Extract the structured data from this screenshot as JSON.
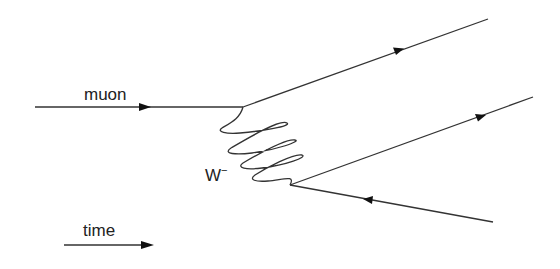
{
  "diagram": {
    "type": "feynman-diagram",
    "labels": {
      "incoming": "muon",
      "boson": "W",
      "boson_charge": "−",
      "time_axis": "time"
    },
    "lines": [
      {
        "name": "incoming-muon",
        "from": [
          35,
          107
        ],
        "to": [
          243,
          107
        ],
        "arrow": "forward"
      },
      {
        "name": "outgoing-top",
        "from": [
          243,
          107
        ],
        "to": [
          488,
          19
        ],
        "arrow": "forward"
      },
      {
        "name": "w-boson",
        "from": [
          243,
          107
        ],
        "to": [
          290,
          185
        ],
        "style": "wavy"
      },
      {
        "name": "outgoing-middle",
        "from": [
          290,
          185
        ],
        "to": [
          533,
          97
        ],
        "arrow": "forward"
      },
      {
        "name": "outgoing-bottom",
        "from": [
          290,
          185
        ],
        "to": [
          493,
          222
        ],
        "arrow": "backward"
      }
    ],
    "stroke_color": "#333333"
  }
}
